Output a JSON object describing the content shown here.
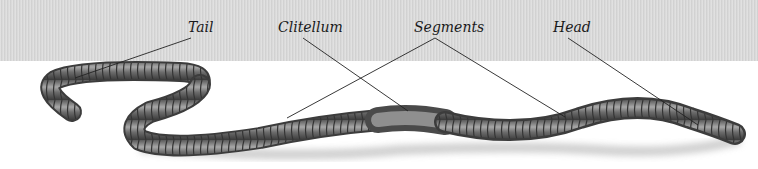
{
  "diagram": {
    "colors": {
      "band": "#dadada",
      "background": "#ffffff",
      "body_dark": "#3a3a3a",
      "body_mid": "#7a7a7a",
      "body_light": "#b8b8b8",
      "leader": "#222222"
    },
    "labels": [
      {
        "id": "tail",
        "text": "Tail",
        "x": 188,
        "y": 20
      },
      {
        "id": "clitellum",
        "text": "Clitellum",
        "x": 278,
        "y": 20
      },
      {
        "id": "segments",
        "text": "Segments",
        "x": 414,
        "y": 20
      },
      {
        "id": "head",
        "text": "Head",
        "x": 553,
        "y": 20
      }
    ],
    "leaders": [
      {
        "label": "tail",
        "from": [
          191,
          38
        ],
        "to": [
          75,
          78
        ]
      },
      {
        "label": "clitellum",
        "from": [
          303,
          38
        ],
        "to": [
          408,
          111
        ]
      },
      {
        "label": "segments",
        "from": [
          435,
          38
        ],
        "to": [
          287,
          118
        ]
      },
      {
        "label": "segments",
        "from": [
          435,
          38
        ],
        "to": [
          565,
          117
        ]
      },
      {
        "label": "head",
        "from": [
          568,
          38
        ],
        "to": [
          698,
          125
        ]
      }
    ]
  }
}
